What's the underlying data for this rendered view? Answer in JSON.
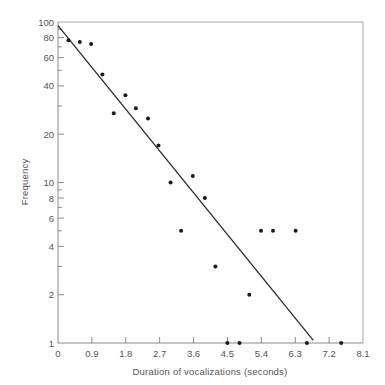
{
  "chart_data": {
    "type": "scatter",
    "title": "",
    "xlabel": "Duration of vocalizations (seconds)",
    "ylabel": "Frequency",
    "xscale": "linear",
    "yscale": "log",
    "xlim": [
      0,
      8.1
    ],
    "ylim": [
      1,
      100
    ],
    "x_ticks": [
      0,
      0.9,
      1.8,
      2.7,
      3.6,
      4.5,
      5.4,
      6.3,
      7.2,
      8.1
    ],
    "x_tick_labels": [
      "0",
      "0.9",
      "1.8",
      "2.7",
      "3.6",
      "4.5",
      "5.4",
      "6.3",
      "7.2",
      "8.1"
    ],
    "y_major_ticks": [
      1,
      2,
      4,
      6,
      8,
      10,
      20,
      40,
      60,
      80,
      100
    ],
    "y_tick_labels": [
      "1",
      "2",
      "4",
      "6",
      "8",
      "10",
      "20",
      "40",
      "60",
      "80",
      "100"
    ],
    "y_minor_ticks": [
      3,
      5,
      7,
      9,
      30,
      50,
      70,
      90
    ],
    "grid": false,
    "legend": null,
    "series": [
      {
        "name": "observed",
        "kind": "points",
        "points": [
          {
            "x": 0.28,
            "y": 77
          },
          {
            "x": 0.58,
            "y": 75
          },
          {
            "x": 0.88,
            "y": 73
          },
          {
            "x": 1.18,
            "y": 47
          },
          {
            "x": 1.48,
            "y": 27
          },
          {
            "x": 1.79,
            "y": 35
          },
          {
            "x": 2.07,
            "y": 29
          },
          {
            "x": 2.39,
            "y": 25
          },
          {
            "x": 2.67,
            "y": 17
          },
          {
            "x": 2.99,
            "y": 10
          },
          {
            "x": 3.27,
            "y": 5
          },
          {
            "x": 3.58,
            "y": 11
          },
          {
            "x": 3.9,
            "y": 8
          },
          {
            "x": 4.18,
            "y": 3
          },
          {
            "x": 4.5,
            "y": 1
          },
          {
            "x": 4.82,
            "y": 1
          },
          {
            "x": 5.08,
            "y": 2
          },
          {
            "x": 5.39,
            "y": 5
          },
          {
            "x": 5.71,
            "y": 5
          },
          {
            "x": 6.31,
            "y": 5
          },
          {
            "x": 6.61,
            "y": 1
          },
          {
            "x": 7.52,
            "y": 1
          }
        ]
      },
      {
        "name": "fitted line",
        "kind": "line",
        "points": [
          {
            "x": 0,
            "y": 95
          },
          {
            "x": 6.78,
            "y": 1.04
          }
        ]
      }
    ]
  }
}
